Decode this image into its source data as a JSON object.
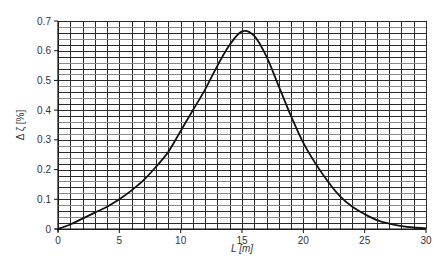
{
  "chart_data": {
    "type": "line",
    "title": "",
    "xlabel": "L  [m]",
    "ylabel": "Δ ζ [%]",
    "xlim": [
      0,
      30
    ],
    "ylim": [
      0,
      0.7
    ],
    "grid": true,
    "grid_x_step": 1,
    "grid_y_step": 0.02,
    "x_ticks": [
      0,
      5,
      10,
      15,
      20,
      25,
      30
    ],
    "y_ticks": [
      0,
      0.1,
      0.2,
      0.3,
      0.4,
      0.5,
      0.6,
      0.7
    ],
    "x_tick_labels": [
      "0",
      "5",
      "10",
      "15",
      "20",
      "25",
      "30"
    ],
    "y_tick_labels": [
      "0",
      "0.1",
      "0.2",
      "0.3",
      "0.4",
      "0.5",
      "0.6",
      "0.7"
    ],
    "legend": null,
    "series": [
      {
        "name": "Δ ζ",
        "color": "#111111",
        "x": [
          0,
          1,
          2,
          3,
          4,
          5,
          6,
          7,
          8,
          9,
          10,
          11,
          12,
          13,
          14,
          15,
          16,
          17,
          18,
          19,
          20,
          21,
          22,
          23,
          24,
          25,
          26,
          27,
          28,
          29,
          30
        ],
        "values": [
          0,
          0.015,
          0.035,
          0.055,
          0.075,
          0.1,
          0.13,
          0.165,
          0.21,
          0.26,
          0.33,
          0.4,
          0.47,
          0.55,
          0.62,
          0.665,
          0.65,
          0.58,
          0.48,
          0.38,
          0.29,
          0.22,
          0.16,
          0.11,
          0.075,
          0.05,
          0.03,
          0.018,
          0.01,
          0.005,
          0.002
        ]
      }
    ]
  },
  "colors": {
    "grid": "#2a2a2a",
    "grid_light": "#8a8a8a",
    "curve": "#111111",
    "text": "#333333"
  }
}
